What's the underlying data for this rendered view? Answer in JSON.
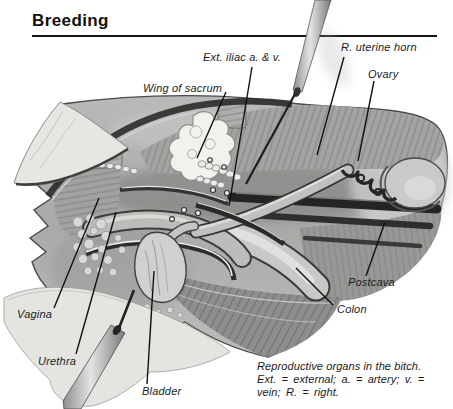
{
  "header": {
    "title": "Breeding"
  },
  "figure": {
    "labels": {
      "ext_iliac": "Ext. iliac a. & v.",
      "wing_of_sacrum": "Wing of sacrum",
      "r_uterine_horn": "R. uterine horn",
      "ovary": "Ovary",
      "postcava": "Postcava",
      "colon": "Colon",
      "vagina": "Vagina",
      "urethra": "Urethra",
      "bladder": "Bladder"
    },
    "caption": {
      "line1": "Reproductive organs in the bitch.",
      "line2": "Ext. = external; a. = artery; v. =",
      "line3": "vein; R. = right."
    }
  },
  "colors": {
    "ink": "#141414",
    "paper": "#ffffff",
    "illustration_light": "#e6e6e3",
    "illustration_mid": "#a8a8a6",
    "illustration_dark": "#2a2a2a"
  }
}
